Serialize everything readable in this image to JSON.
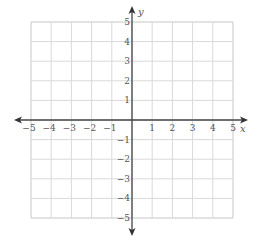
{
  "chart_data": {
    "type": "coordinate-grid",
    "title": "",
    "xlabel": "x",
    "ylabel": "y",
    "xlim": [
      -5,
      5
    ],
    "ylim": [
      -5,
      5
    ],
    "grid": true,
    "x_ticks": [
      "-5",
      "-4",
      "-3",
      "-2",
      "-1",
      "1",
      "2",
      "3",
      "4",
      "5"
    ],
    "y_ticks": [
      "5",
      "4",
      "3",
      "2",
      "1",
      "-1",
      "-2",
      "-3",
      "-4",
      "-5"
    ],
    "data": []
  },
  "colors": {
    "grid": "#d9d9d9",
    "axis": "#444444",
    "label": "#555555"
  },
  "layout": {
    "origin_x": 132,
    "origin_y": 120,
    "unit_x": 20.2,
    "unit_y": 19.6
  }
}
